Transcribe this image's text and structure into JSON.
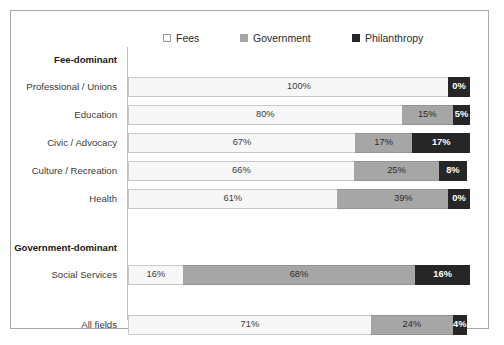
{
  "chart_data": {
    "type": "bar",
    "subtype": "stacked-horizontal-100pct",
    "title": "",
    "xlabel": "",
    "ylabel": "",
    "xlim": [
      0,
      100
    ],
    "grid": false,
    "legend_position": "top",
    "series": [
      {
        "name": "Fees",
        "color": "#f7f7f7",
        "values": [
          100,
          80,
          67,
          66,
          61,
          16,
          71
        ]
      },
      {
        "name": "Government",
        "color": "#a6a6a6",
        "values": [
          0,
          15,
          17,
          25,
          39,
          68,
          24
        ]
      },
      {
        "name": "Philanthropy",
        "color": "#262626",
        "values": [
          0,
          5,
          17,
          8,
          0,
          16,
          4
        ]
      }
    ],
    "categories": [
      "Professional / Unions",
      "Education",
      "Civic / Advocacy",
      "Culture / Recreation",
      "Health",
      "Social Services",
      "All fields"
    ],
    "group_headers": [
      "Fee-dominant",
      "Government-dominant"
    ]
  },
  "legend": {
    "items": [
      {
        "label": "Fees",
        "swatch": "legend-swatch-fees",
        "color": "#ffffff",
        "border": "#9a9a9a"
      },
      {
        "label": "Government",
        "swatch": "legend-swatch-government",
        "color": "#a6a6a6",
        "border": "#a6a6a6"
      },
      {
        "label": "Philanthropy",
        "swatch": "legend-swatch-philanthropy",
        "color": "#262626",
        "border": "#262626"
      }
    ]
  },
  "rows": [
    {
      "kind": "group",
      "label": "Fee-dominant"
    },
    {
      "kind": "data",
      "label": "Professional / Unions",
      "fees": 100,
      "government": 0,
      "philanthropy": 0,
      "fees_text": "100%",
      "government_text": "",
      "philanthropy_text": "0%"
    },
    {
      "kind": "data",
      "label": "Education",
      "fees": 80,
      "government": 15,
      "philanthropy": 5,
      "fees_text": "80%",
      "government_text": "15%",
      "philanthropy_text": "5%"
    },
    {
      "kind": "data",
      "label": "Civic / Advocacy",
      "fees": 67,
      "government": 17,
      "philanthropy": 17,
      "fees_text": "67%",
      "government_text": "17%",
      "philanthropy_text": "17%"
    },
    {
      "kind": "data",
      "label": "Culture / Recreation",
      "fees": 66,
      "government": 25,
      "philanthropy": 8,
      "fees_text": "66%",
      "government_text": "25%",
      "philanthropy_text": "8%"
    },
    {
      "kind": "data",
      "label": "Health",
      "fees": 61,
      "government": 39,
      "philanthropy": 0,
      "fees_text": "61%",
      "government_text": "39%",
      "philanthropy_text": "0%"
    },
    {
      "kind": "spacer",
      "label": ""
    },
    {
      "kind": "group",
      "label": "Government-dominant"
    },
    {
      "kind": "data",
      "label": "Social Services",
      "fees": 16,
      "government": 68,
      "philanthropy": 16,
      "fees_text": "16%",
      "government_text": "68%",
      "philanthropy_text": "16%"
    },
    {
      "kind": "spacer",
      "label": ""
    },
    {
      "kind": "data",
      "label": "All fields",
      "fees": 71,
      "government": 24,
      "philanthropy": 4,
      "fees_text": "71%",
      "government_text": "24%",
      "philanthropy_text": "4%"
    }
  ]
}
